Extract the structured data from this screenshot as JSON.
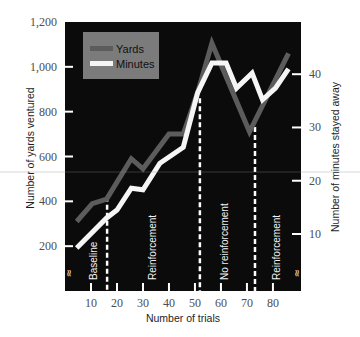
{
  "chart_data": {
    "type": "line",
    "title": "",
    "xlabel": "Number of trials",
    "ylabel": "Number of yards ventured",
    "y2label": "Number of minutes stayed away",
    "xlim": [
      0,
      90.8
    ],
    "ylim": [
      0,
      1200
    ],
    "y2lim": [
      -0.7,
      49.8
    ],
    "grid": false,
    "x_ticks": [
      {
        "value": 10,
        "label": "10"
      },
      {
        "value": 20,
        "label": "20"
      },
      {
        "value": 30,
        "label": "30"
      },
      {
        "value": 40,
        "label": "40"
      },
      {
        "value": 50,
        "label": "50"
      },
      {
        "value": 60,
        "label": "60"
      },
      {
        "value": 70,
        "label": "70"
      },
      {
        "value": 80,
        "label": "80"
      }
    ],
    "y_ticks": [
      {
        "value": 200,
        "label": "200"
      },
      {
        "value": 400,
        "label": "400"
      },
      {
        "value": 600,
        "label": "600"
      },
      {
        "value": 800,
        "label": "800"
      },
      {
        "value": 1000,
        "label": "1,000"
      },
      {
        "value": 1200,
        "label": "1,200"
      }
    ],
    "y2_ticks": [
      {
        "value": 10,
        "label": "10"
      },
      {
        "value": 20,
        "label": "20"
      },
      {
        "value": 30,
        "label": "30"
      },
      {
        "value": 40,
        "label": "40"
      }
    ],
    "legend": {
      "position": "upper-left",
      "background": "#7b7b7b"
    },
    "series": [
      {
        "name": "Yards",
        "axis": "left",
        "color": "#5c5c5c",
        "x": [
          4.5,
          10.5,
          16,
          25.5,
          30,
          40,
          45.5,
          51,
          56.5,
          71,
          86
        ],
        "y": [
          310,
          390,
          410,
          590,
          545,
          700,
          700,
          885,
          1105,
          710,
          1060
        ]
      },
      {
        "name": "Minutes",
        "axis": "right",
        "color": "#f5f5f5",
        "x": [
          4.5,
          16,
          20,
          25.5,
          30,
          36.5,
          45.5,
          51,
          56.5,
          62,
          66,
          72,
          76,
          81,
          86
        ],
        "y": [
          7.4,
          13,
          14.5,
          18.6,
          18.3,
          23.3,
          26.3,
          36.5,
          42.1,
          42.1,
          37.4,
          40.2,
          35.2,
          37.4,
          41
        ]
      }
    ],
    "phase_dividers": [
      {
        "trial": 16.2,
        "top_yards": 420
      },
      {
        "trial": 51.9,
        "top_yards": 860
      },
      {
        "trial": 73.1,
        "top_yards": 732
      }
    ],
    "phases": [
      {
        "label": "Baseline",
        "trial": 10.8
      },
      {
        "label": "Reinforcement",
        "trial": 33.8
      },
      {
        "label": "No reinforcement",
        "trial": 61.5
      },
      {
        "label": "Reinforcement",
        "trial": 81.5
      }
    ],
    "axis_breaks": [
      {
        "symbol": "≈",
        "trial": 1.5
      },
      {
        "symbol": "≈",
        "trial": 89.2
      }
    ],
    "colors": {
      "plot_background": "#0b0b0b",
      "divider": "#ffffff",
      "tick": "#ffffff"
    }
  }
}
